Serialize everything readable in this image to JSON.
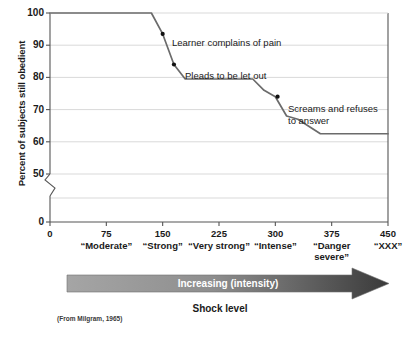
{
  "chart_data": {
    "type": "line",
    "title": "",
    "xlabel": "Shock level",
    "ylabel": "Percent of subjects still obedient",
    "xlim": [
      0,
      450
    ],
    "ylim": [
      50,
      100
    ],
    "y_axis_break": true,
    "y_break_label": "0",
    "grid": true,
    "legend": "none",
    "yticks": [
      100,
      90,
      80,
      70,
      60,
      50
    ],
    "ytick_labels": [
      "100",
      "90",
      "80",
      "70",
      "60",
      "50"
    ],
    "xticks": [
      0,
      75,
      150,
      225,
      300,
      375,
      450
    ],
    "xtick_labels": [
      "0",
      "75",
      "150",
      "225",
      "300",
      "375",
      "450"
    ],
    "x_category_labels": [
      "",
      "“Moderate”",
      "“Strong”",
      "“Very strong”",
      "“Intense”",
      "“Danger\nsevere”",
      "“XXX”"
    ],
    "x": [
      0,
      135,
      150,
      165,
      180,
      270,
      285,
      300,
      315,
      330,
      360,
      450
    ],
    "values": [
      100,
      100,
      93.5,
      84,
      79.5,
      79.5,
      76,
      74,
      68,
      67,
      62.5,
      62.5
    ],
    "markers": [
      {
        "x": 150,
        "y": 93.5,
        "label": "Learner complains of pain"
      },
      {
        "x": 165,
        "y": 84,
        "label": "Pleads to be let out"
      },
      {
        "x": 303,
        "y": 74,
        "label": "Screams and refuses\nto answer"
      }
    ],
    "annotations": [
      {
        "text": "Learner complains of pain"
      },
      {
        "text": "Pleads to be let out"
      },
      {
        "text": "Screams and refuses\nto answer"
      }
    ],
    "arrow_label": "Increasing (intensity)",
    "source": "(From Milgram, 1965)",
    "colors": {
      "line": "#6b6b6b",
      "marker": "#111111",
      "grid": "#d9d9d9",
      "axis": "#555555",
      "arrow_light": "#9a9a9a",
      "arrow_dark": "#3d3d3d",
      "text": "#1a1a1a"
    }
  }
}
